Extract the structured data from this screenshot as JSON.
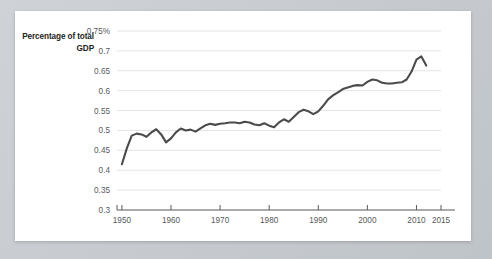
{
  "card": {
    "background_color": "#ffffff",
    "page_background_color": "#c9cdd2"
  },
  "axis_title": "Percentage of total GDP",
  "chart_data": {
    "type": "line",
    "title": "",
    "subtitle": "",
    "xlabel": "",
    "ylabel": "Percentage of total GDP",
    "grid": true,
    "legend_position": "none",
    "line_color": "#4b4b4b",
    "gridline_color": "#e3e3e3",
    "axis_color": "#58595b",
    "xlim": [
      1949,
      2015
    ],
    "ylim": [
      0.3,
      0.75
    ],
    "ytick_labels": [
      "0.75%",
      "0.7",
      "0.65",
      "0.6",
      "0.55",
      "0.5",
      "0.45",
      "0.4",
      "0.35",
      "0.3"
    ],
    "yticks": [
      0.75,
      0.7,
      0.65,
      0.6,
      0.55,
      0.5,
      0.45,
      0.4,
      0.35,
      0.3
    ],
    "xtick_labels": [
      "1950",
      "1960",
      "1970",
      "1980",
      "1990",
      "2000",
      "2010",
      "2015"
    ],
    "xticks": [
      1950,
      1960,
      1970,
      1980,
      1990,
      2000,
      2010,
      2015
    ],
    "series": [
      {
        "name": "Percentage of total GDP",
        "x": [
          1950,
          1951,
          1952,
          1953,
          1954,
          1955,
          1956,
          1957,
          1958,
          1959,
          1960,
          1961,
          1962,
          1963,
          1964,
          1965,
          1966,
          1967,
          1968,
          1969,
          1970,
          1971,
          1972,
          1973,
          1974,
          1975,
          1976,
          1977,
          1978,
          1979,
          1980,
          1981,
          1982,
          1983,
          1984,
          1985,
          1986,
          1987,
          1988,
          1989,
          1990,
          1991,
          1992,
          1993,
          1994,
          1995,
          1996,
          1997,
          1998,
          1999,
          2000,
          2001,
          2002,
          2003,
          2004,
          2005,
          2006,
          2007,
          2008,
          2009,
          2010,
          2011,
          2012
        ],
        "values": [
          0.415,
          0.455,
          0.487,
          0.492,
          0.49,
          0.484,
          0.495,
          0.503,
          0.49,
          0.47,
          0.48,
          0.495,
          0.505,
          0.5,
          0.502,
          0.497,
          0.505,
          0.513,
          0.517,
          0.514,
          0.517,
          0.518,
          0.52,
          0.52,
          0.518,
          0.522,
          0.52,
          0.515,
          0.513,
          0.518,
          0.512,
          0.508,
          0.52,
          0.528,
          0.522,
          0.534,
          0.546,
          0.552,
          0.548,
          0.541,
          0.548,
          0.562,
          0.578,
          0.588,
          0.596,
          0.604,
          0.608,
          0.612,
          0.614,
          0.613,
          0.622,
          0.628,
          0.626,
          0.62,
          0.618,
          0.618,
          0.62,
          0.621,
          0.628,
          0.648,
          0.678,
          0.686,
          0.663
        ]
      }
    ]
  }
}
